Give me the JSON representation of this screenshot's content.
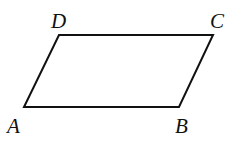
{
  "figure": {
    "type": "parallelogram",
    "stroke_color": "#111111",
    "background": "#ffffff",
    "vertices": [
      {
        "label": "A",
        "x": 24,
        "y": 107,
        "label_x": 7,
        "label_y": 133
      },
      {
        "label": "B",
        "x": 179,
        "y": 107,
        "label_x": 175,
        "label_y": 133
      },
      {
        "label": "C",
        "x": 213,
        "y": 35,
        "label_x": 210,
        "label_y": 28
      },
      {
        "label": "D",
        "x": 59,
        "y": 35,
        "label_x": 51,
        "label_y": 28
      }
    ],
    "labels": {
      "A": "A",
      "B": "B",
      "C": "C",
      "D": "D"
    }
  }
}
